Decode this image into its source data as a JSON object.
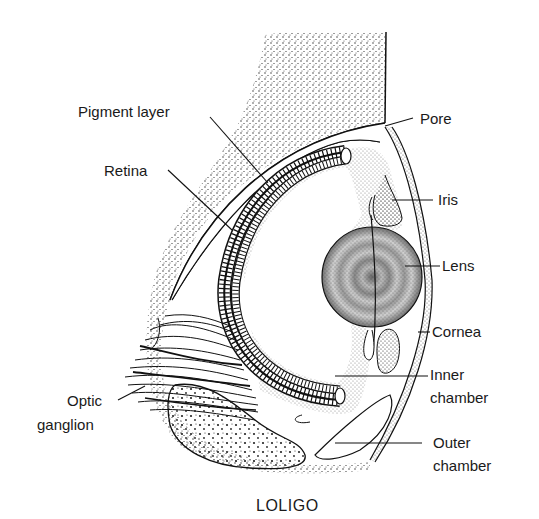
{
  "figure": {
    "caption": "LOLIGO",
    "labels": {
      "pigment_layer": "Pigment layer",
      "retina": "Retina",
      "pore": "Pore",
      "iris": "Iris",
      "lens": "Lens",
      "cornea": "Cornea",
      "inner_chamber_1": "Inner",
      "inner_chamber_2": "chamber",
      "outer_chamber_1": "Outer",
      "outer_chamber_2": "chamber",
      "optic_ganglion_1": "Optic",
      "optic_ganglion_2": "ganglion"
    }
  },
  "colors": {
    "ink": "#1a1a1a",
    "background": "#ffffff"
  }
}
